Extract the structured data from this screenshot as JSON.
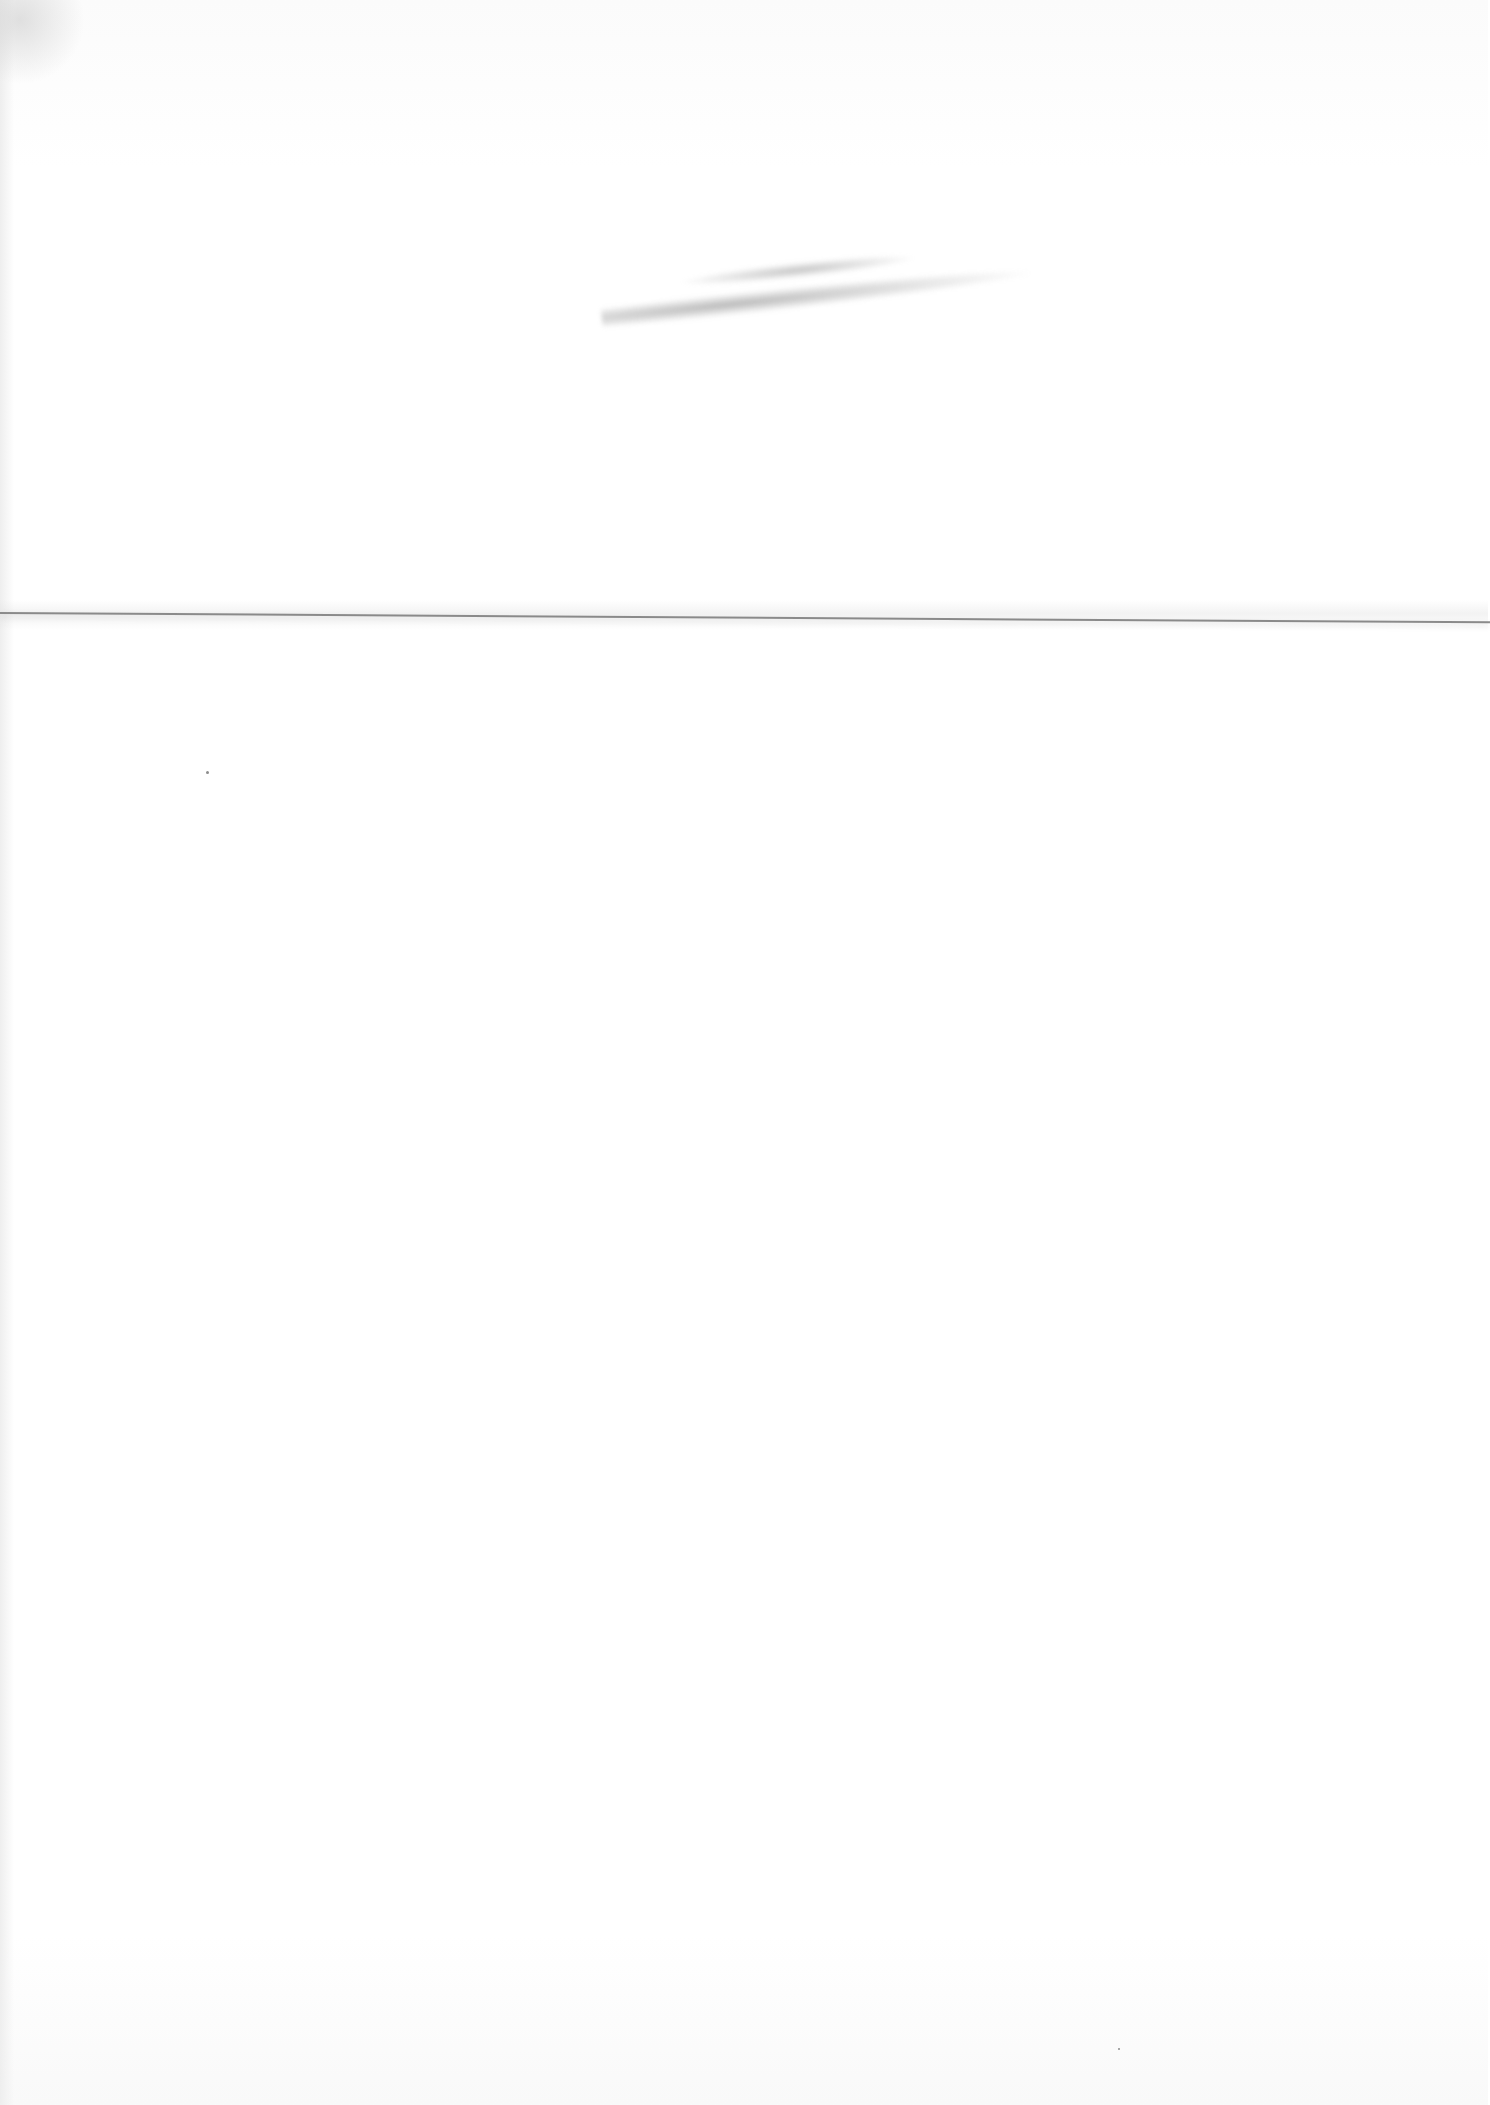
{
  "document": {
    "description": "Blank scanned sheet of paper with a horizontal fold crease and a faint illegible pencil smudge",
    "text_content": "",
    "background_color": "#ffffff",
    "fold_line_color": "#8a8a8a",
    "smudge_color": "#9a9a9a"
  }
}
